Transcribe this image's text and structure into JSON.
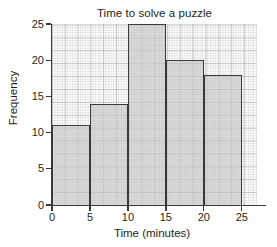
{
  "chart_data": {
    "type": "bar",
    "title": "Time to solve a puzzle",
    "xlabel": "Time (minutes)",
    "ylabel": "Frequency",
    "categories": [
      "0-5",
      "5-10",
      "10-15",
      "15-20",
      "20-25"
    ],
    "bin_edges": [
      0,
      5,
      10,
      15,
      20,
      25
    ],
    "values": [
      11,
      14,
      25,
      20,
      18
    ],
    "xlim": [
      0,
      27
    ],
    "ylim": [
      0,
      25
    ],
    "xticks": [
      "0",
      "5",
      "10",
      "15",
      "20",
      "25"
    ],
    "xtick_values": [
      0,
      5,
      10,
      15,
      20,
      25
    ],
    "yticks": [
      "0",
      "5",
      "10",
      "15",
      "20",
      "25"
    ],
    "ytick_values": [
      0,
      5,
      10,
      15,
      20,
      25
    ],
    "grid": true,
    "legend": null,
    "bar_fill_color": "#c4c4c4",
    "bar_edge_color": "#3a3a3a",
    "grid_color": "#b4b4b4",
    "background_color": "#ffffff",
    "text_color": "#231f20"
  }
}
